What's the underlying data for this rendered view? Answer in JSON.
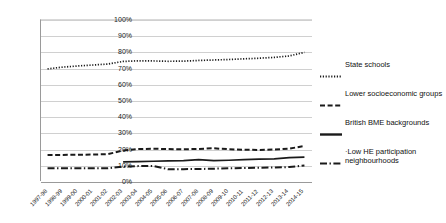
{
  "chart_data": {
    "type": "line",
    "title": "",
    "xlabel": "",
    "ylabel": "",
    "ylim": [
      0,
      100
    ],
    "ytick_labels": [
      "100%",
      "90%",
      "80%",
      "70%",
      "60%",
      "50%",
      "40%",
      "30%",
      "20%",
      "10%",
      "0%"
    ],
    "ytick_values": [
      100,
      90,
      80,
      70,
      60,
      50,
      40,
      30,
      20,
      10,
      0
    ],
    "grid": true,
    "legend_position": "right",
    "categories": [
      "1997-98",
      "1998-99",
      "1999-00",
      "2000-01",
      "2001-02",
      "2002-03",
      "2003-04",
      "2004-05",
      "2005-06",
      "2006-07",
      "2007-08",
      "2008-09",
      "2009-10",
      "2010-11",
      "2011-12",
      "2012-13",
      "2013-14",
      "2014-15"
    ],
    "series": [
      {
        "name": "State schools",
        "style": "dotted",
        "color": "#1a1a1a",
        "values": [
          69.2,
          70.3,
          71.0,
          71.6,
          72.2,
          73.8,
          74.2,
          74.1,
          73.9,
          74.0,
          74.4,
          74.7,
          75.0,
          75.4,
          75.8,
          76.3,
          77.2,
          79.4
        ]
      },
      {
        "name": "Lower socioeconomic groups",
        "style": "dashed",
        "color": "#1a1a1a",
        "values": [
          16.0,
          16.1,
          16.2,
          16.3,
          16.6,
          18.8,
          19.7,
          19.9,
          19.7,
          19.6,
          19.8,
          20.2,
          19.6,
          19.3,
          19.2,
          19.4,
          20.0,
          21.6
        ]
      },
      {
        "name": "British BME backgrounds",
        "style": "solid",
        "color": "#1a1a1a",
        "values": [
          null,
          null,
          null,
          null,
          null,
          11.8,
          12.0,
          12.2,
          12.4,
          12.6,
          13.2,
          12.6,
          12.8,
          13.2,
          13.5,
          13.7,
          14.4,
          14.7
        ]
      },
      {
        "name": "Low HE participation neighbourhoods",
        "style": "dashdot",
        "color": "#1a1a1a",
        "values": [
          7.8,
          7.8,
          7.8,
          7.8,
          7.9,
          8.9,
          9.2,
          9.3,
          7.2,
          7.3,
          7.4,
          7.6,
          7.8,
          8.0,
          8.2,
          8.3,
          8.6,
          9.6
        ]
      }
    ]
  },
  "legend": {
    "items": [
      {
        "label": "State schools",
        "style": "dotted"
      },
      {
        "label": "Lower socioeconomic groups",
        "style": "dashed"
      },
      {
        "label": "British BME backgrounds",
        "style": "solid"
      },
      {
        "label": "·Low HE participation neighbourhoods",
        "style": "dashdot"
      }
    ]
  }
}
